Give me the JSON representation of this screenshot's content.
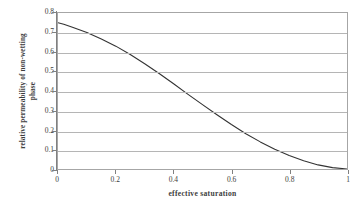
{
  "chart_data": {
    "type": "line",
    "title": "",
    "xlabel": "effective saturation",
    "ylabel_line1": "relative permeability of non-wetting",
    "ylabel_line2": "phase",
    "xlim": [
      0,
      1
    ],
    "ylim": [
      0,
      0.8
    ],
    "grid": true,
    "legend": "none",
    "line_color": "#333333",
    "grid_color": "#b5b5b5",
    "frame_color": "#a6a6a6",
    "x_ticks": [
      "0",
      "0.2",
      "0.4",
      "0.6",
      "0.8",
      "1"
    ],
    "x_tick_values": [
      0,
      0.2,
      0.4,
      0.6,
      0.8,
      1
    ],
    "y_ticks": [
      "0",
      "0.1",
      "0.2",
      "0.3",
      "0.4",
      "0.5",
      "0.6",
      "0.7",
      "0.8"
    ],
    "y_tick_values": [
      0,
      0.1,
      0.2,
      0.3,
      0.4,
      0.5,
      0.6,
      0.7,
      0.8
    ],
    "series": [
      {
        "name": "relative permeability of non-wetting phase",
        "x": [
          0.0,
          0.02,
          0.05,
          0.1,
          0.15,
          0.2,
          0.25,
          0.3,
          0.35,
          0.4,
          0.45,
          0.5,
          0.55,
          0.6,
          0.65,
          0.7,
          0.75,
          0.8,
          0.85,
          0.9,
          0.95,
          1.0
        ],
        "values": [
          0.75,
          0.742,
          0.727,
          0.7,
          0.667,
          0.63,
          0.587,
          0.54,
          0.49,
          0.437,
          0.383,
          0.33,
          0.278,
          0.228,
          0.181,
          0.139,
          0.101,
          0.069,
          0.042,
          0.021,
          0.007,
          0.0
        ]
      }
    ]
  }
}
